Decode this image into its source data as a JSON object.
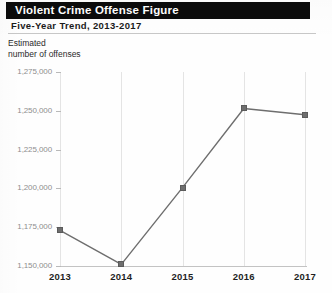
{
  "header": {
    "title": "Violent Crime Offense Figure",
    "subtitle": "Five-Year Trend, 2013-2017"
  },
  "axis_title": {
    "line1": "Estimated",
    "line2": "number of offenses"
  },
  "colors": {
    "title_bar_background": "#0b0b0b",
    "title_text": "#ffffff",
    "line": "#6e6e6e",
    "marker": "#6e6e6e",
    "gridline": "#e4e4e4",
    "axis": "#b9b9b9",
    "y_tick_label": "#8e8e8e",
    "x_tick_label": "#1f1f1f"
  },
  "chart_data": {
    "type": "line",
    "title": "Violent Crime Offense Figure",
    "subtitle": "Five-Year Trend, 2013-2017",
    "xlabel": "",
    "ylabel": "Estimated number of offenses",
    "categories": [
      "2013",
      "2014",
      "2015",
      "2016",
      "2017"
    ],
    "values": [
      1173000,
      1151000,
      1200500,
      1251500,
      1247500
    ],
    "ylim": [
      1150000,
      1275000
    ],
    "ytick_values": [
      1150000,
      1175000,
      1200000,
      1225000,
      1250000,
      1275000
    ],
    "ytick_labels": [
      "1,150,000",
      "1,175,000",
      "1,200,000",
      "1,225,000",
      "1,250,000",
      "1,275,000"
    ],
    "xtick_labels": [
      "2013",
      "2014",
      "2015",
      "2016",
      "2017"
    ],
    "grid": "vertical",
    "legend": "none",
    "marker": "square",
    "series": [
      {
        "name": "Estimated number of offenses",
        "values": [
          1173000,
          1151000,
          1200500,
          1251500,
          1247500
        ]
      }
    ]
  }
}
